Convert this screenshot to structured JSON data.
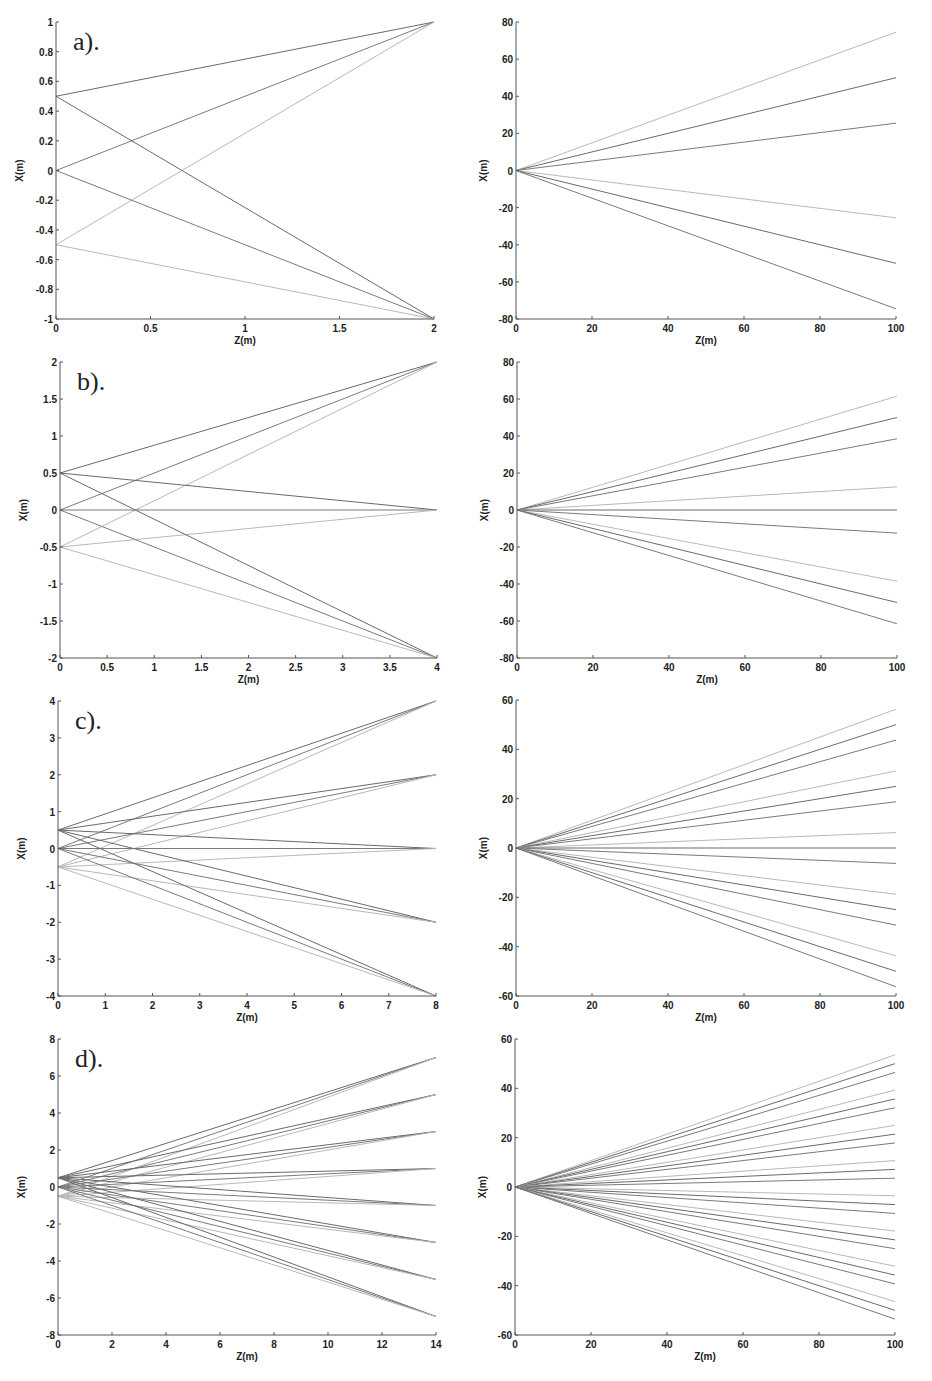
{
  "figure": {
    "background": "#ffffff",
    "line_colors": {
      "src_0.5": "#6a6a6a",
      "src_0": "#7a7a7a",
      "src_-0.5": "#b8b8b8"
    }
  },
  "chart_data": [
    {
      "id": "a-left",
      "panel_label": "a).",
      "type": "line",
      "xlabel": "Z(m)",
      "ylabel": "X(m)",
      "xlim": [
        0,
        2
      ],
      "ylim": [
        -1,
        1
      ],
      "xticks": [
        0,
        0.5,
        1,
        1.5,
        2
      ],
      "xtick_labels": [
        "0",
        "0.5",
        "1",
        "1.5",
        "2"
      ],
      "yticks": [
        -1,
        -0.8,
        -0.6,
        -0.4,
        -0.2,
        0,
        0.2,
        0.4,
        0.6,
        0.8,
        1
      ],
      "ytick_labels": [
        "-1",
        "-0.8",
        "-0.6",
        "-0.4",
        "-0.2",
        "0",
        "0.2",
        "0.4",
        "0.6",
        "0.8",
        "1"
      ],
      "box": {
        "left": 56,
        "top": 22,
        "right": 434,
        "bottom": 319
      },
      "sources": [
        0.5,
        0,
        -0.5
      ],
      "targets": [
        1,
        -1
      ],
      "z_end": 2
    },
    {
      "id": "a-right",
      "panel_label": "",
      "type": "line",
      "xlabel": "Z(m)",
      "ylabel": "X(m)",
      "xlim": [
        0,
        100
      ],
      "ylim": [
        -80,
        80
      ],
      "xticks": [
        0,
        20,
        40,
        60,
        80,
        100
      ],
      "xtick_labels": [
        "0",
        "20",
        "40",
        "60",
        "80",
        "100"
      ],
      "yticks": [
        -80,
        -60,
        -40,
        -20,
        0,
        20,
        40,
        60,
        80
      ],
      "ytick_labels": [
        "-80",
        "-60",
        "-40",
        "-20",
        "0",
        "20",
        "40",
        "60",
        "80"
      ],
      "box": {
        "left": 516,
        "top": 22,
        "right": 896,
        "bottom": 319
      },
      "series_endpoints_at_100": [
        74.5,
        50,
        25.5,
        -25.5,
        -50,
        -74.5
      ]
    },
    {
      "id": "b-left",
      "panel_label": "b).",
      "type": "line",
      "xlabel": "Z(m)",
      "ylabel": "X(m)",
      "xlim": [
        0,
        4
      ],
      "ylim": [
        -2,
        2
      ],
      "xticks": [
        0,
        0.5,
        1,
        1.5,
        2,
        2.5,
        3,
        3.5,
        4
      ],
      "xtick_labels": [
        "0",
        "0.5",
        "1",
        "1.5",
        "2",
        "2.5",
        "3",
        "3.5",
        "4"
      ],
      "yticks": [
        -2,
        -1.5,
        -1,
        -0.5,
        0,
        0.5,
        1,
        1.5,
        2
      ],
      "ytick_labels": [
        "-2",
        "-1.5",
        "-1",
        "-0.5",
        "0",
        "0.5",
        "1",
        "1.5",
        "2"
      ],
      "box": {
        "left": 60,
        "top": 362,
        "right": 437,
        "bottom": 658
      },
      "sources": [
        0.5,
        0,
        -0.5
      ],
      "targets": [
        2,
        0,
        -2
      ],
      "z_end": 4
    },
    {
      "id": "b-right",
      "panel_label": "",
      "type": "line",
      "xlabel": "Z(m)",
      "ylabel": "X(m)",
      "xlim": [
        0,
        100
      ],
      "ylim": [
        -80,
        80
      ],
      "xticks": [
        0,
        20,
        40,
        60,
        80,
        100
      ],
      "xtick_labels": [
        "0",
        "20",
        "40",
        "60",
        "80",
        "100"
      ],
      "yticks": [
        -80,
        -60,
        -40,
        -20,
        0,
        20,
        40,
        60,
        80
      ],
      "ytick_labels": [
        "-80",
        "-60",
        "-40",
        "-20",
        "0",
        "20",
        "40",
        "60",
        "80"
      ],
      "box": {
        "left": 517,
        "top": 362,
        "right": 897,
        "bottom": 658
      },
      "series_endpoints_at_100": [
        61.5,
        50,
        38.5,
        12.5,
        0,
        -12.5,
        -38.5,
        -50,
        -61.5
      ]
    },
    {
      "id": "c-left",
      "panel_label": "c).",
      "type": "line",
      "xlabel": "Z(m)",
      "ylabel": "X(m)",
      "xlim": [
        0,
        8
      ],
      "ylim": [
        -4,
        4
      ],
      "xticks": [
        0,
        1,
        2,
        3,
        4,
        5,
        6,
        7,
        8
      ],
      "xtick_labels": [
        "0",
        "1",
        "2",
        "3",
        "4",
        "5",
        "6",
        "7",
        "8"
      ],
      "yticks": [
        -4,
        -3,
        -2,
        -1,
        0,
        1,
        2,
        3,
        4
      ],
      "ytick_labels": [
        "-4",
        "-3",
        "-2",
        "-1",
        "0",
        "1",
        "2",
        "3",
        "4"
      ],
      "box": {
        "left": 58,
        "top": 701,
        "right": 436,
        "bottom": 996
      },
      "sources": [
        0.5,
        0,
        -0.5
      ],
      "targets": [
        4,
        2,
        0,
        -2,
        -4
      ],
      "z_end": 8
    },
    {
      "id": "c-right",
      "panel_label": "",
      "type": "line",
      "xlabel": "Z(m)",
      "ylabel": "X(m)",
      "xlim": [
        0,
        100
      ],
      "ylim": [
        -60,
        60
      ],
      "xticks": [
        0,
        20,
        40,
        60,
        80,
        100
      ],
      "xtick_labels": [
        "0",
        "20",
        "40",
        "60",
        "80",
        "100"
      ],
      "yticks": [
        -60,
        -40,
        -20,
        0,
        20,
        40,
        60
      ],
      "ytick_labels": [
        "-60",
        "-40",
        "-20",
        "0",
        "20",
        "40",
        "60"
      ],
      "box": {
        "left": 516,
        "top": 700,
        "right": 896,
        "bottom": 996
      },
      "series_endpoints_at_100": [
        56.25,
        50,
        43.75,
        31.25,
        25,
        18.75,
        6.25,
        0,
        -6.25,
        -18.75,
        -25,
        -31.25,
        -43.75,
        -50,
        -56.25
      ]
    },
    {
      "id": "d-left",
      "panel_label": "d).",
      "type": "line",
      "xlabel": "Z(m)",
      "ylabel": "X(m)",
      "xlim": [
        0,
        14
      ],
      "ylim": [
        -8,
        8
      ],
      "xticks": [
        0,
        2,
        4,
        6,
        8,
        10,
        12,
        14
      ],
      "xtick_labels": [
        "0",
        "2",
        "4",
        "6",
        "8",
        "10",
        "12",
        "14"
      ],
      "yticks": [
        -8,
        -6,
        -4,
        -2,
        0,
        2,
        4,
        6,
        8
      ],
      "ytick_labels": [
        "-8",
        "-6",
        "-4",
        "-2",
        "0",
        "2",
        "4",
        "6",
        "8"
      ],
      "box": {
        "left": 58,
        "top": 1039,
        "right": 436,
        "bottom": 1335
      },
      "sources": [
        0.5,
        0,
        -0.5
      ],
      "targets": [
        7,
        5,
        3,
        1,
        -1,
        -3,
        -5,
        -7
      ],
      "z_end": 14
    },
    {
      "id": "d-right",
      "panel_label": "",
      "type": "line",
      "xlabel": "Z(m)",
      "ylabel": "X(m)",
      "xlim": [
        0,
        100
      ],
      "ylim": [
        -60,
        60
      ],
      "xticks": [
        0,
        20,
        40,
        60,
        80,
        100
      ],
      "xtick_labels": [
        "0",
        "20",
        "40",
        "60",
        "80",
        "100"
      ],
      "yticks": [
        -60,
        -40,
        -20,
        0,
        20,
        40,
        60
      ],
      "ytick_labels": [
        "-60",
        "-40",
        "-20",
        "0",
        "20",
        "40",
        "60"
      ],
      "box": {
        "left": 515,
        "top": 1039,
        "right": 895,
        "bottom": 1335
      },
      "series_endpoints_at_100": [
        53.57,
        50,
        46.43,
        39.29,
        35.71,
        32.14,
        25,
        21.43,
        17.86,
        10.71,
        7.14,
        3.57,
        -3.57,
        -7.14,
        -10.71,
        -17.86,
        -21.43,
        -25,
        -32.14,
        -35.71,
        -39.29,
        -46.43,
        -50,
        -53.57
      ]
    }
  ]
}
